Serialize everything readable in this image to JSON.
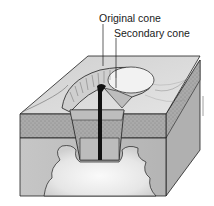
{
  "diagram": {
    "labels": {
      "original_cone": "Original cone",
      "secondary_cone": "Secondary cone"
    },
    "colors": {
      "background": "#ffffff",
      "outline": "#1e1e1e",
      "top_surface": "#d9d9d9",
      "crater_floor": "#f2f2f2",
      "sediment_layer": "#a9a9a9",
      "bedrock_front": "#bdbdbd",
      "bedrock_side": "#b0b0b0",
      "magma_chamber": "#efefef",
      "conduit": "#111111"
    }
  }
}
